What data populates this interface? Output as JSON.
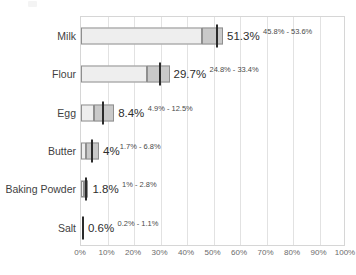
{
  "chart_data": {
    "type": "bar",
    "title": "",
    "subtitle": "",
    "xlabel": "",
    "ylabel": "",
    "orientation": "horizontal",
    "xlim": [
      0,
      100
    ],
    "grid": true,
    "legend": "none",
    "x_tick_labels": [
      "0%",
      "10%",
      "20%",
      "30%",
      "40%",
      "50%",
      "60%",
      "70%",
      "80%",
      "90%",
      "100%"
    ],
    "x_tick_values": [
      0,
      10,
      20,
      30,
      40,
      50,
      60,
      70,
      80,
      90,
      100
    ],
    "categories": [
      "Milk",
      "Flour",
      "Egg",
      "Butter",
      "Baking Powder",
      "Salt"
    ],
    "values": [
      51.3,
      29.7,
      8.4,
      4.0,
      1.8,
      0.6
    ],
    "ci_low": [
      45.8,
      24.8,
      4.9,
      1.7,
      1.0,
      0.2
    ],
    "ci_high": [
      53.6,
      33.4,
      12.5,
      6.8,
      2.8,
      1.1
    ],
    "value_labels": [
      "51.3%",
      "29.7%",
      "8.4%",
      "4%",
      "1.8%",
      "0.6%"
    ],
    "ci_labels": [
      "45.8% - 53.6%",
      "24.8% - 33.4%",
      "4.9% - 12.5%",
      "1.7% - 6.8%",
      "1% - 2.8%",
      "0.2% - 1.1%"
    ],
    "rows": [
      {
        "category": "Milk",
        "value": 51.3,
        "value_label": "51.3%",
        "ci_low": 45.8,
        "ci_high": 53.6,
        "ci_label": "45.8% - 53.6%"
      },
      {
        "category": "Flour",
        "value": 29.7,
        "value_label": "29.7%",
        "ci_low": 24.8,
        "ci_high": 33.4,
        "ci_label": "24.8% - 33.4%"
      },
      {
        "category": "Egg",
        "value": 8.4,
        "value_label": "8.4%",
        "ci_low": 4.9,
        "ci_high": 12.5,
        "ci_label": "4.9% - 12.5%"
      },
      {
        "category": "Butter",
        "value": 4.0,
        "value_label": "4%",
        "ci_low": 1.7,
        "ci_high": 6.8,
        "ci_label": "1.7% - 6.8%"
      },
      {
        "category": "Baking Powder",
        "value": 1.8,
        "value_label": "1.8%",
        "ci_low": 1.0,
        "ci_high": 2.8,
        "ci_label": "1% - 2.8%"
      },
      {
        "category": "Salt",
        "value": 0.6,
        "value_label": "0.6%",
        "ci_low": 0.2,
        "ci_high": 1.1,
        "ci_label": "0.2% - 1.1%"
      }
    ],
    "colors": {
      "bar_fill": "#eeeeee",
      "ci_fill": "#c9c9c9",
      "bar_border": "#8f8f8f",
      "tick_marker": "#2b2b2b",
      "gridline": "#e2e2e2",
      "frame": "#d6d6d6",
      "background": "#ffffff",
      "label_text": "#3f3f3f",
      "axis_text": "#6b6b6b"
    }
  }
}
